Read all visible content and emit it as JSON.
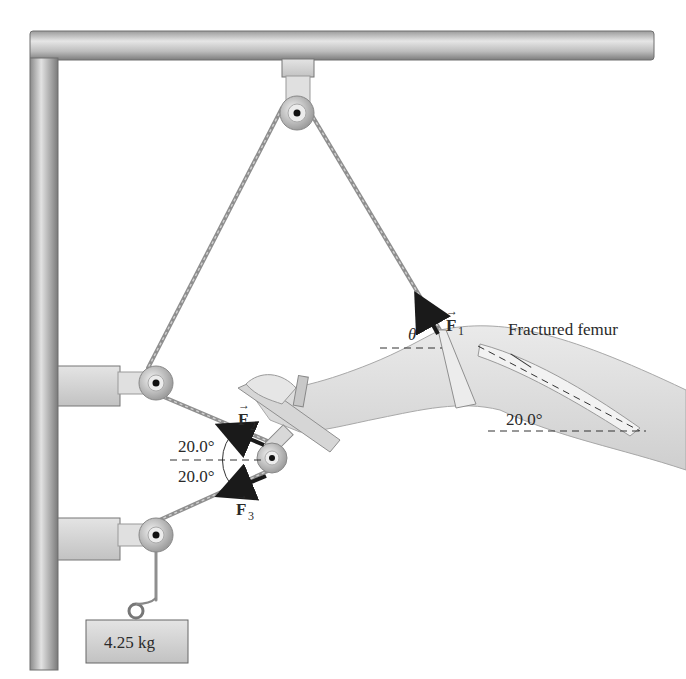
{
  "figure": {
    "labels": {
      "fractured_femur": "Fractured femur",
      "femur_angle": "20.0°",
      "angle_upper": "20.0°",
      "angle_lower": "20.0°",
      "theta": "θ",
      "mass": "4.25 kg"
    },
    "forces": [
      {
        "symbol": "F",
        "subscript": "1",
        "arrow": "→",
        "direction": "up-left along top rope, angle θ from horizontal"
      },
      {
        "symbol": "F",
        "subscript": "2",
        "arrow": "→",
        "direction": "20.0° above horizontal toward upper wall pulley"
      },
      {
        "symbol": "F",
        "subscript": "3",
        "arrow": "→",
        "direction": "20.0° below horizontal toward lower wall pulley"
      }
    ],
    "colors": {
      "metal_light": "#d9d9d9",
      "metal_dark": "#8c8c8c",
      "skin": "#dcdcdc",
      "arrow": "#1a1a1a",
      "text": "#2a2a2a"
    }
  }
}
